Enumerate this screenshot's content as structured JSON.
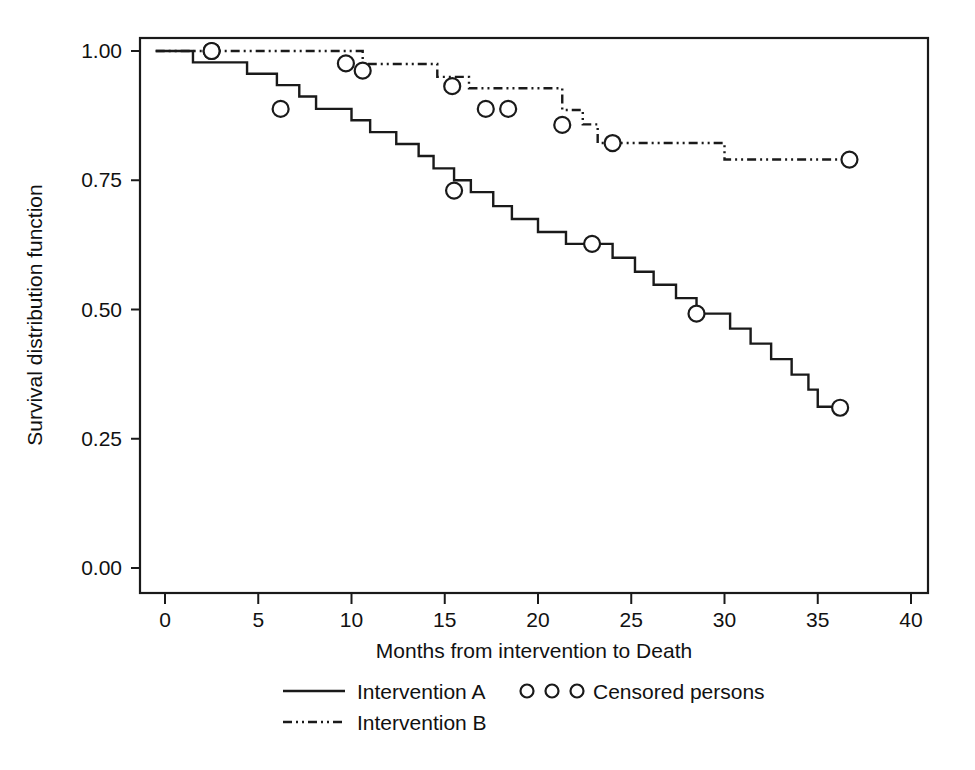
{
  "chart_data": {
    "type": "line",
    "subtype": "kaplan-meier-survival-step",
    "title": "",
    "xlabel": "Months from intervention to Death",
    "ylabel": "Survival distribution function",
    "xlim": [
      -1,
      41
    ],
    "ylim": [
      0.0,
      1.0
    ],
    "grid": false,
    "xticks": [
      0,
      5,
      10,
      15,
      20,
      25,
      30,
      35,
      40
    ],
    "xtick_labels": [
      "0",
      "5",
      "10",
      "15",
      "20",
      "25",
      "30",
      "35",
      "40"
    ],
    "yticks": [
      0.0,
      0.25,
      0.5,
      0.75,
      1.0
    ],
    "ytick_labels": [
      "0.00",
      "0.25",
      "0.50",
      "0.75",
      "1.00"
    ],
    "legend_position": "below-axes",
    "line_color": "#1a1a1a",
    "series": [
      {
        "name": "Intervention A",
        "style": "solid",
        "steps": [
          [
            -0.5,
            1.0
          ],
          [
            1.5,
            1.0
          ],
          [
            1.5,
            0.978
          ],
          [
            4.4,
            0.978
          ],
          [
            4.4,
            0.956
          ],
          [
            6.0,
            0.956
          ],
          [
            6.0,
            0.934
          ],
          [
            7.2,
            0.934
          ],
          [
            7.2,
            0.912
          ],
          [
            8.1,
            0.912
          ],
          [
            8.1,
            0.888
          ],
          [
            10.0,
            0.888
          ],
          [
            10.0,
            0.866
          ],
          [
            11.0,
            0.866
          ],
          [
            11.0,
            0.843
          ],
          [
            12.4,
            0.843
          ],
          [
            12.4,
            0.82
          ],
          [
            13.6,
            0.82
          ],
          [
            13.6,
            0.797
          ],
          [
            14.4,
            0.797
          ],
          [
            14.4,
            0.773
          ],
          [
            15.5,
            0.773
          ],
          [
            15.5,
            0.75
          ],
          [
            16.4,
            0.75
          ],
          [
            16.4,
            0.727
          ],
          [
            17.6,
            0.727
          ],
          [
            17.6,
            0.7
          ],
          [
            18.6,
            0.7
          ],
          [
            18.6,
            0.675
          ],
          [
            20.0,
            0.675
          ],
          [
            20.0,
            0.65
          ],
          [
            21.5,
            0.65
          ],
          [
            21.5,
            0.627
          ],
          [
            24.0,
            0.627
          ],
          [
            24.0,
            0.6
          ],
          [
            25.2,
            0.6
          ],
          [
            25.2,
            0.573
          ],
          [
            26.2,
            0.573
          ],
          [
            26.2,
            0.548
          ],
          [
            27.4,
            0.548
          ],
          [
            27.4,
            0.522
          ],
          [
            28.5,
            0.522
          ],
          [
            28.5,
            0.492
          ],
          [
            30.3,
            0.492
          ],
          [
            30.3,
            0.463
          ],
          [
            31.4,
            0.463
          ],
          [
            31.4,
            0.434
          ],
          [
            32.5,
            0.434
          ],
          [
            32.5,
            0.404
          ],
          [
            33.6,
            0.404
          ],
          [
            33.6,
            0.374
          ],
          [
            34.5,
            0.374
          ],
          [
            34.5,
            0.345
          ],
          [
            35.0,
            0.345
          ],
          [
            35.0,
            0.312
          ],
          [
            36.2,
            0.312
          ]
        ],
        "censored": [
          [
            2.5,
            1.0
          ],
          [
            6.2,
            0.888
          ],
          [
            15.5,
            0.73
          ],
          [
            22.9,
            0.627
          ],
          [
            28.5,
            0.492
          ],
          [
            36.2,
            0.31
          ]
        ]
      },
      {
        "name": "Intervention B",
        "style": "dash-dot-dot",
        "steps": [
          [
            -0.5,
            1.0
          ],
          [
            10.6,
            1.0
          ],
          [
            10.6,
            0.975
          ],
          [
            14.6,
            0.975
          ],
          [
            14.6,
            0.95
          ],
          [
            16.3,
            0.95
          ],
          [
            16.3,
            0.928
          ],
          [
            21.3,
            0.928
          ],
          [
            21.3,
            0.886
          ],
          [
            22.4,
            0.886
          ],
          [
            22.4,
            0.858
          ],
          [
            23.2,
            0.858
          ],
          [
            23.2,
            0.822
          ],
          [
            30.0,
            0.822
          ],
          [
            30.0,
            0.79
          ],
          [
            37.0,
            0.79
          ]
        ],
        "censored": [
          [
            2.5,
            1.0
          ],
          [
            9.7,
            0.976
          ],
          [
            10.6,
            0.962
          ],
          [
            15.4,
            0.932
          ],
          [
            17.2,
            0.888
          ],
          [
            18.4,
            0.888
          ],
          [
            21.3,
            0.857
          ],
          [
            24.0,
            0.822
          ],
          [
            36.7,
            0.79
          ]
        ]
      }
    ],
    "legend": [
      {
        "label": "Intervention A",
        "marker": "solid-line"
      },
      {
        "label": "Intervention B",
        "marker": "dash-dot-dot-line"
      },
      {
        "label": "Censored persons",
        "marker": "three-open-circles"
      }
    ]
  }
}
